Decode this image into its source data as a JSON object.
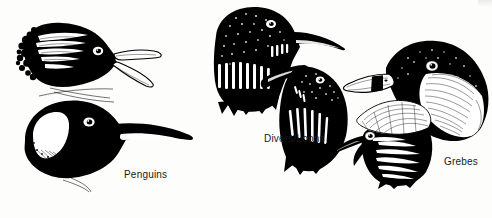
{
  "plate": {
    "title": "Bird head profiles comparison plate",
    "background_color": "#fdfdfc",
    "ink_color": "#000000",
    "width": 492,
    "height": 218,
    "style": "black-and-white scratchboard / pen-and-ink scientific illustration"
  },
  "groups": [
    {
      "id": "penguins",
      "label": "Penguins",
      "label_x": 124,
      "label_y": 170,
      "count": 2,
      "figures": [
        {
          "id": "crested-penguin-head",
          "name": "crested penguin head, open gaping bill",
          "features": "white supercilial plumes streaming back, open bill showing gape, shaggy nape"
        },
        {
          "id": "king-penguin-head",
          "name": "large penguin head, long slender bill",
          "features": "white auricular patch, long decurved bill with pale mandibular stripe, dark crown"
        }
      ]
    },
    {
      "id": "divers-loons",
      "label": "Divers/Loons",
      "label_x": 264,
      "label_y": 136,
      "count": 2,
      "figures": [
        {
          "id": "loon-head-upper",
          "name": "loon head, dagger bill held level",
          "features": "glossy black head, vertical white neck-stripe collar, heavy straight bill"
        },
        {
          "id": "loon-head-lower",
          "name": "loon head, bill tilted upward",
          "features": "white vertical throat stripes, uptilted dagger bill, speckled crown"
        }
      ]
    },
    {
      "id": "grebes",
      "label": "Grebes",
      "label_x": 444,
      "label_y": 157,
      "count": 2,
      "figures": [
        {
          "id": "pied-billed-grebe-head",
          "name": "grebe head with banded stout bill",
          "features": "thick pale bill crossed by a black vertical band, pale eye-ring, finely streaked cheek"
        },
        {
          "id": "crested-grebe-head",
          "name": "crested grebe head with ruff",
          "features": "radiating plume ruff, thin pointed bill, pale eye, dark crest"
        }
      ]
    }
  ]
}
